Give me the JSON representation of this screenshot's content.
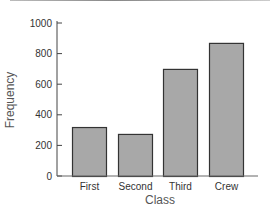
{
  "chart_data": {
    "type": "bar",
    "title": "",
    "xlabel": "Class",
    "ylabel": "Frequency",
    "categories": [
      "First",
      "Second",
      "Third",
      "Crew"
    ],
    "values": [
      320,
      275,
      700,
      870
    ],
    "ylim": [
      0,
      1000
    ],
    "yticks": [
      0,
      200,
      400,
      600,
      800,
      1000
    ],
    "grid": false,
    "legend": null,
    "bar_color": "#a8a8a8",
    "bar_edge_color": "#333333"
  }
}
